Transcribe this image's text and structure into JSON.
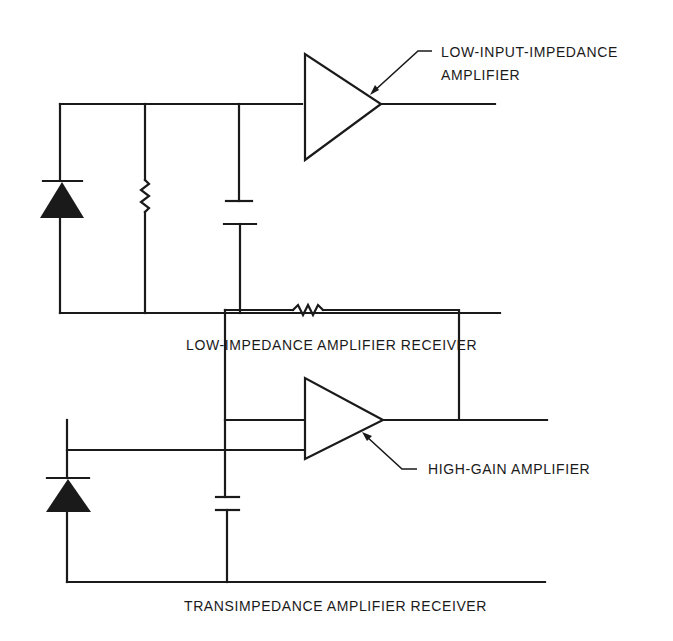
{
  "diagrams": [
    {
      "caption": "LOW-IMPEDANCE AMPLIFIER RECEIVER",
      "amplifier_label": [
        "LOW-INPUT-IMPEDANCE",
        "AMPLIFIER"
      ],
      "components": [
        "photodiode",
        "resistor",
        "capacitor",
        "amplifier"
      ]
    },
    {
      "caption": "TRANSIMPEDANCE AMPLIFIER RECEIVER",
      "amplifier_label": [
        "HIGH-GAIN AMPLIFIER"
      ],
      "components": [
        "photodiode",
        "capacitor",
        "amplifier",
        "feedback-resistor"
      ]
    }
  ],
  "colors": {
    "ink": "#1a1a1a",
    "background": "#ffffff"
  }
}
